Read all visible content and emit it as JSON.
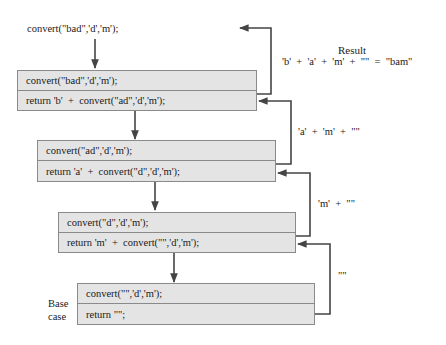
{
  "title_call": "convert(\"bad\",'d','m');",
  "result": {
    "label": "Result",
    "expression": "'b'  +  'a'  +  'm'  +  \"\"  =  \"bam\""
  },
  "frames": [
    {
      "call": "convert(\"bad\",'d','m');",
      "return": "return 'b'  +  convert(\"ad\",'d','m');"
    },
    {
      "call": "convert(\"ad\",'d','m');",
      "return": "return 'a'  +  convert(\"d\",'d','m');"
    },
    {
      "call": "convert(\"d\",'d','m');",
      "return": "return 'm'  +  convert(\"\",'d','m');"
    },
    {
      "call": "convert(\"\",'d','m');",
      "return": "return \"\";"
    }
  ],
  "return_labels": [
    "'a'  +  'm'  +  \"\"",
    "'m'  +  \"\"",
    "\"\""
  ],
  "base_case_label": {
    "line1": "Base",
    "line2": "case"
  },
  "colors": {
    "box_fill": "#e4e4e4",
    "box_border": "#8a8a8a",
    "arrow": "#444444"
  }
}
